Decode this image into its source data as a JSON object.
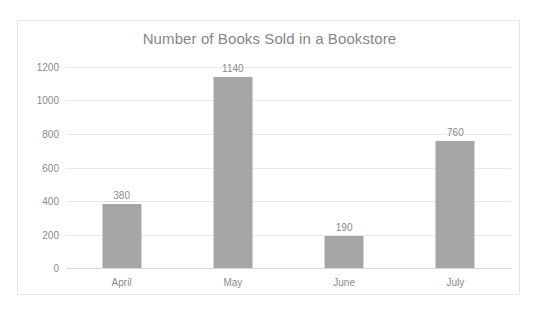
{
  "chart_data": {
    "type": "bar",
    "title": "Number of Books Sold in a Bookstore",
    "xlabel": "",
    "ylabel": "",
    "categories": [
      "April",
      "May",
      "June",
      "July"
    ],
    "values": [
      380,
      1140,
      190,
      760
    ],
    "data_labels": [
      "380",
      "1140",
      "190",
      "760"
    ],
    "ylim": [
      0,
      1200
    ],
    "ytick_labels": [
      "0",
      "200",
      "400",
      "600",
      "800",
      "1000",
      "1200"
    ],
    "ytick_values": [
      0,
      200,
      400,
      600,
      800,
      1000,
      1200
    ],
    "grid": true,
    "grid_axis": "y",
    "legend": false,
    "legend_position": "none",
    "series": [
      {
        "name": "Books Sold",
        "values": [
          380,
          1140,
          190,
          760
        ],
        "color": "#a6a6a6"
      }
    ],
    "colors": {
      "bar": "#a6a6a6",
      "title_text": "#868686",
      "tick_text": "#8a8a8a",
      "gridline": "#e8e8e8",
      "axis_line": "#d9d9d9",
      "plot_background": "#ffffff",
      "frame_border": "#e6e6e6"
    }
  }
}
